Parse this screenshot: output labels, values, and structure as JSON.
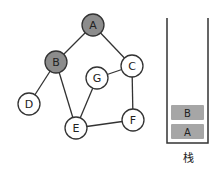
{
  "graph": {
    "nodes": [
      {
        "id": "A",
        "label": "A",
        "x": 93,
        "y": 25,
        "visited": true
      },
      {
        "id": "B",
        "label": "B",
        "x": 56,
        "y": 62,
        "visited": true
      },
      {
        "id": "C",
        "label": "C",
        "x": 132,
        "y": 66,
        "visited": false
      },
      {
        "id": "G",
        "label": "G",
        "x": 97,
        "y": 78,
        "visited": false
      },
      {
        "id": "D",
        "label": "D",
        "x": 29,
        "y": 104,
        "visited": false
      },
      {
        "id": "E",
        "label": "E",
        "x": 76,
        "y": 128,
        "visited": false
      },
      {
        "id": "F",
        "label": "F",
        "x": 133,
        "y": 120,
        "visited": false
      }
    ],
    "edges": [
      [
        "A",
        "B"
      ],
      [
        "A",
        "C"
      ],
      [
        "B",
        "D"
      ],
      [
        "B",
        "E"
      ],
      [
        "C",
        "G"
      ],
      [
        "C",
        "F"
      ],
      [
        "G",
        "E"
      ],
      [
        "E",
        "F"
      ]
    ],
    "colors": {
      "visited_fill": "#8c8c8c",
      "unvisited_fill": "#ffffff",
      "stroke": "#333333"
    }
  },
  "stack": {
    "label": "栈",
    "items": [
      {
        "label": "B"
      },
      {
        "label": "A"
      }
    ],
    "item_fill": "#a6a6a6"
  }
}
